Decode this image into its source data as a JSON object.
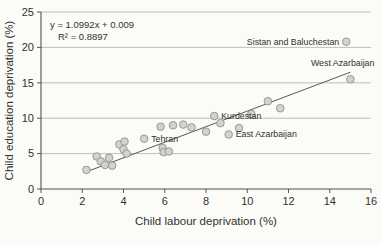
{
  "figure": {
    "background": "#fbfbf8",
    "axis_color": "#55534e",
    "grid_color": "#b0aea8",
    "text_color": "#33312c",
    "point_fill": "#d4d2ce",
    "point_stroke": "#92908b",
    "trend_color": "#5a5854"
  },
  "chart_data": {
    "type": "scatter",
    "title": "",
    "xlabel": "Child labour deprivation (%)",
    "ylabel": "Child education deprivation (%)",
    "xlim": [
      0,
      16
    ],
    "ylim": [
      0,
      25
    ],
    "xticks": [
      0,
      2,
      4,
      6,
      8,
      10,
      12,
      14,
      16
    ],
    "yticks": [
      0,
      5,
      10,
      15,
      20,
      25
    ],
    "grid": "horizontal",
    "legend": "none",
    "equation": "y = 1.0992x + 0.009",
    "r_squared": "R² = 0.8897",
    "trendline": {
      "slope": 1.0992,
      "intercept": 0.009,
      "x_start": 2.2,
      "x_end": 15.0
    },
    "points": [
      [
        2.2,
        2.7
      ],
      [
        2.7,
        4.6
      ],
      [
        2.9,
        3.9
      ],
      [
        3.1,
        3.4
      ],
      [
        3.3,
        4.4
      ],
      [
        3.45,
        3.3
      ],
      [
        3.8,
        6.3
      ],
      [
        4.0,
        5.6
      ],
      [
        4.05,
        6.7
      ],
      [
        4.15,
        5.0
      ],
      [
        5.8,
        8.8
      ],
      [
        5.9,
        5.8
      ],
      [
        5.95,
        5.2
      ],
      [
        6.2,
        5.3
      ],
      [
        6.4,
        9.0
      ],
      [
        6.9,
        9.1
      ],
      [
        7.3,
        8.7
      ],
      [
        8.0,
        8.1
      ],
      [
        8.7,
        9.3
      ],
      [
        9.6,
        8.6
      ],
      [
        10.2,
        10.6
      ],
      [
        11.0,
        12.4
      ],
      [
        11.6,
        11.4
      ]
    ],
    "labeled_points": [
      {
        "label": "Sistan and Baluchestan",
        "x": 14.8,
        "y": 20.8,
        "side": "left"
      },
      {
        "label": "West Azarbaijan",
        "x": 15.0,
        "y": 15.5,
        "side": "above-left"
      },
      {
        "label": "Kurdestan",
        "x": 8.4,
        "y": 10.3,
        "side": "right"
      },
      {
        "label": "Tehran",
        "x": 5.0,
        "y": 7.1,
        "side": "right"
      },
      {
        "label": "East Azarbaijan",
        "x": 9.1,
        "y": 7.7,
        "side": "right"
      }
    ]
  }
}
